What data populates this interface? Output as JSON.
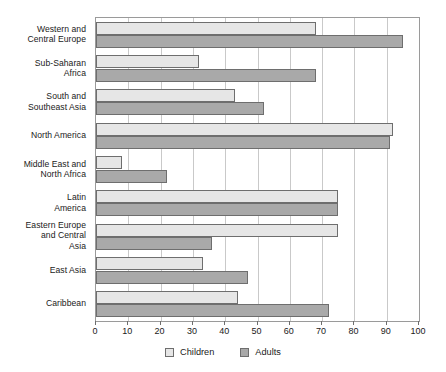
{
  "chart_data": {
    "type": "bar",
    "orientation": "horizontal",
    "title": "",
    "subtitle": "",
    "xlabel": "",
    "ylabel": "",
    "xlim": [
      0,
      100
    ],
    "xticks": [
      0,
      10,
      20,
      30,
      40,
      50,
      60,
      70,
      80,
      90,
      100
    ],
    "xtick_labels": [
      "0",
      "10",
      "20",
      "30",
      "40",
      "50",
      "60",
      "70",
      "80",
      "90",
      "100"
    ],
    "grid": "vertical",
    "legend_position": "bottom-center",
    "categories": [
      "Western and Central Europe",
      "Sub-Saharan Africa",
      "South and Southeast Asia",
      "North America",
      "Middle East and North Africa",
      "Latin America",
      "Eastern Europe and Central Asia",
      "East Asia",
      "Caribbean"
    ],
    "category_label_lines": [
      [
        "Western and",
        "Central Europe"
      ],
      [
        "Sub-Saharan",
        "Africa"
      ],
      [
        "South and",
        "Southeast Asia"
      ],
      [
        "North America"
      ],
      [
        "Middle East and",
        "North Africa"
      ],
      [
        "Latin",
        "America"
      ],
      [
        "Eastern Europe",
        "and Central",
        "Asia"
      ],
      [
        "East Asia"
      ],
      [
        "Caribbean"
      ]
    ],
    "series": [
      {
        "name": "Children",
        "color": "#e6e6e6",
        "values": [
          68,
          32,
          43,
          92,
          8,
          75,
          75,
          33,
          44
        ]
      },
      {
        "name": "Adults",
        "color": "#a9a9a9",
        "values": [
          95,
          68,
          52,
          91,
          22,
          75,
          36,
          47,
          72
        ]
      }
    ]
  },
  "legend": {
    "items": [
      {
        "label": "Children",
        "swatch": "children"
      },
      {
        "label": "Adults",
        "swatch": "adults"
      }
    ]
  },
  "colors": {
    "children_fill": "#e6e6e6",
    "adults_fill": "#a9a9a9",
    "bar_outline": "#6e6e6e",
    "gridline": "#c9c9c9",
    "axis": "#9a9a9a",
    "text": "#1a1a1a",
    "background": "#ffffff"
  }
}
